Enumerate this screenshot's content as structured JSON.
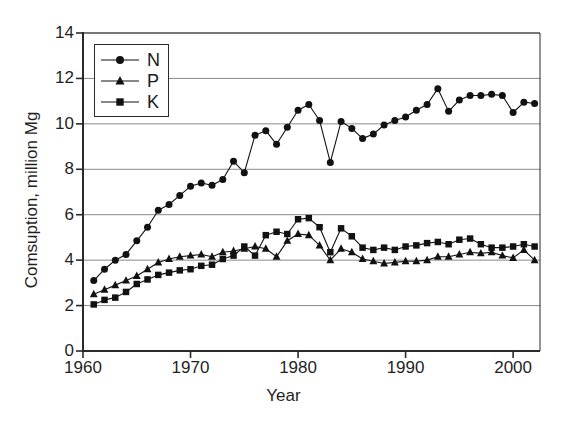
{
  "chart_data": {
    "type": "line",
    "title": "",
    "xlabel": "Year",
    "ylabel": "Comsuption, million Mg",
    "xlim": [
      1960,
      2002.5
    ],
    "ylim": [
      0,
      14
    ],
    "xticks": [
      1960,
      1970,
      1980,
      1990,
      2000
    ],
    "yticks": [
      0,
      2,
      4,
      6,
      8,
      10,
      12,
      14
    ],
    "grid": "horizontal",
    "legend_position": "upper-left-inside",
    "x": [
      1961,
      1962,
      1963,
      1964,
      1965,
      1966,
      1967,
      1968,
      1969,
      1970,
      1971,
      1972,
      1973,
      1974,
      1975,
      1976,
      1977,
      1978,
      1979,
      1980,
      1981,
      1982,
      1983,
      1984,
      1985,
      1986,
      1987,
      1988,
      1989,
      1990,
      1991,
      1992,
      1993,
      1994,
      1995,
      1996,
      1997,
      1998,
      1999,
      2000,
      2001,
      2002
    ],
    "series": [
      {
        "name": "N",
        "marker": "circle",
        "color": "#111111",
        "values": [
          3.1,
          3.6,
          4.0,
          4.25,
          4.85,
          5.45,
          6.2,
          6.45,
          6.85,
          7.25,
          7.4,
          7.3,
          7.55,
          8.35,
          7.85,
          9.5,
          9.7,
          9.1,
          9.85,
          10.6,
          10.85,
          10.15,
          8.3,
          10.1,
          9.8,
          9.35,
          9.55,
          9.95,
          10.15,
          10.3,
          10.6,
          10.85,
          11.55,
          10.55,
          11.05,
          11.25,
          11.25,
          11.3,
          11.25,
          10.5,
          10.95,
          10.9
        ]
      },
      {
        "name": "P",
        "marker": "triangle",
        "color": "#111111",
        "values": [
          2.5,
          2.7,
          2.9,
          3.1,
          3.3,
          3.6,
          3.9,
          4.05,
          4.15,
          4.2,
          4.25,
          4.15,
          4.35,
          4.4,
          4.5,
          4.6,
          4.5,
          4.15,
          4.85,
          5.15,
          5.1,
          4.65,
          4.0,
          4.5,
          4.35,
          4.05,
          3.95,
          3.85,
          3.9,
          3.95,
          3.95,
          4.0,
          4.15,
          4.15,
          4.25,
          4.35,
          4.3,
          4.35,
          4.2,
          4.1,
          4.45,
          4.0
        ]
      },
      {
        "name": "K",
        "marker": "square",
        "color": "#111111",
        "values": [
          2.05,
          2.25,
          2.35,
          2.6,
          2.95,
          3.15,
          3.35,
          3.45,
          3.55,
          3.6,
          3.75,
          3.8,
          4.05,
          4.2,
          4.6,
          4.2,
          5.1,
          5.25,
          5.15,
          5.8,
          5.85,
          5.45,
          4.35,
          5.4,
          5.05,
          4.55,
          4.45,
          4.55,
          4.45,
          4.6,
          4.65,
          4.75,
          4.8,
          4.7,
          4.9,
          4.95,
          4.7,
          4.55,
          4.55,
          4.6,
          4.7,
          4.6
        ]
      }
    ]
  },
  "legend": {
    "entries": [
      {
        "label": "N",
        "marker": "circle"
      },
      {
        "label": "P",
        "marker": "triangle"
      },
      {
        "label": "K",
        "marker": "square"
      }
    ]
  },
  "style": {
    "axis_color": "#2a2a2a",
    "grid_color": "#8a8a8a",
    "plot_background": "#ffffff",
    "marker_color": "#111111"
  }
}
